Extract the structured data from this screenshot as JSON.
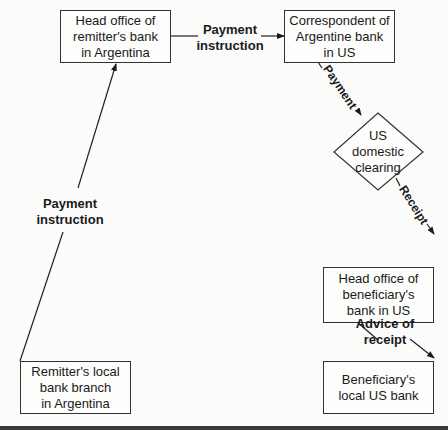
{
  "nodes": {
    "remitter_head_office": "Head office of\nremitter's bank\nin Argentina",
    "correspondent_us": "Correspondent of\nArgentine bank\nin US",
    "us_clearing": "US\ndomestic\nclearing",
    "beneficiary_head_office": "Head office of\nbeneficiary's\nbank in US",
    "beneficiary_local": "Beneficiary's\nlocal US bank",
    "remitter_local": "Remitter's local\nbank branch\nin Argentina"
  },
  "edges": {
    "local_to_head": "Payment\ninstruction",
    "head_to_correspondent": "Payment\ninstruction",
    "correspondent_to_clearing": "Payment",
    "clearing_to_beneficiary_head": "Receipt",
    "head_to_local_us": "Advice of\nreceipt"
  }
}
